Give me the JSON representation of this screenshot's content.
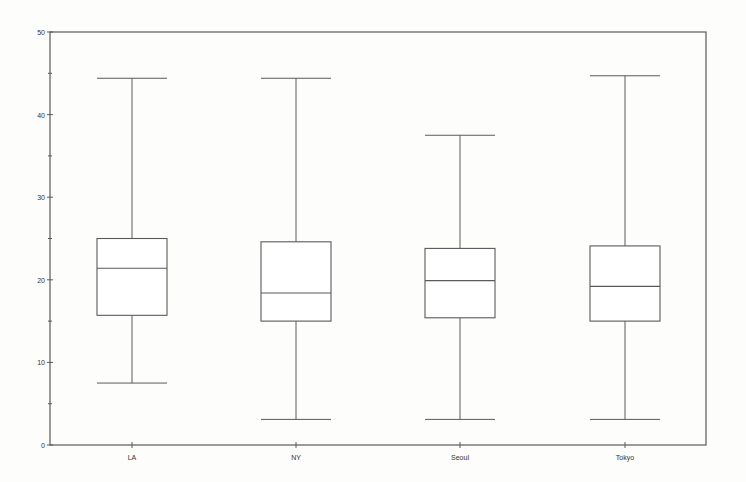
{
  "chart_data": {
    "type": "box",
    "title": "",
    "xlabel": "",
    "ylabel": "",
    "ylim": [
      0,
      50
    ],
    "yticks_major": [
      0,
      10,
      20,
      30,
      40,
      50
    ],
    "yticks_minor": [
      5,
      15,
      25,
      35,
      45
    ],
    "grid": false,
    "legend": null,
    "categories": [
      "LA",
      "NY",
      "Seoul",
      "Tokyo"
    ],
    "boxes": [
      {
        "label": "LA",
        "whisker_low": 7.5,
        "q1": 15.7,
        "median": 21.4,
        "q3": 25.0,
        "whisker_high": 44.4
      },
      {
        "label": "NY",
        "whisker_low": 3.1,
        "q1": 15.0,
        "median": 18.4,
        "q3": 24.6,
        "whisker_high": 44.4
      },
      {
        "label": "Seoul",
        "whisker_low": 3.1,
        "q1": 15.4,
        "median": 19.9,
        "q3": 23.8,
        "whisker_high": 37.5
      },
      {
        "label": "Tokyo",
        "whisker_low": 3.1,
        "q1": 15.0,
        "median": 19.2,
        "q3": 24.1,
        "whisker_high": 44.7
      }
    ]
  },
  "style": {
    "background": "#fdfdfb",
    "line_color": "#5a5a5a",
    "box_fill": "#ffffff"
  }
}
